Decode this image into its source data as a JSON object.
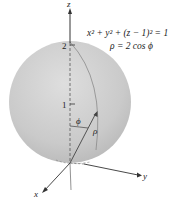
{
  "figure": {
    "equation_cartesian": "x² + y² + (z − 1)² = 1",
    "equation_spherical": "ρ = 2 cos ϕ",
    "axes": {
      "x": "x",
      "y": "y",
      "z": "z"
    },
    "ticks": {
      "z1": "1",
      "z2": "2"
    },
    "symbols": {
      "phi": "ϕ",
      "rho": "ρ"
    },
    "colors": {
      "sphere": "#c9c9c9",
      "sphere_edge": "#b0b0b0",
      "axis": "#333333",
      "background": "#ffffff"
    }
  }
}
